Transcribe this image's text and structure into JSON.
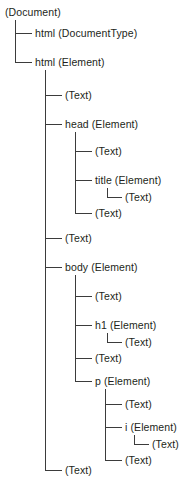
{
  "diagram": {
    "type": "tree",
    "background_color": "#ffffff",
    "text_color": "#231f20",
    "line_color": "#3b3b3b",
    "nodes": [
      {
        "id": "n0",
        "label": "(Document)",
        "depth": 0,
        "x": 5,
        "y": 12,
        "last": false
      },
      {
        "id": "n1",
        "label": "html (DocumentType)",
        "depth": 1,
        "x": 35,
        "y": 33,
        "last": false
      },
      {
        "id": "n2",
        "label": "html (Element)",
        "depth": 1,
        "x": 35,
        "y": 62,
        "last": true
      },
      {
        "id": "n3",
        "label": "(Text)",
        "depth": 2,
        "x": 65,
        "y": 95,
        "last": false
      },
      {
        "id": "n4",
        "label": "head (Element)",
        "depth": 2,
        "x": 65,
        "y": 124,
        "last": false
      },
      {
        "id": "n5",
        "label": "(Text)",
        "depth": 3,
        "x": 95,
        "y": 151,
        "last": false
      },
      {
        "id": "n6",
        "label": "title (Element)",
        "depth": 3,
        "x": 95,
        "y": 180,
        "last": false
      },
      {
        "id": "n7",
        "label": "(Text)",
        "depth": 4,
        "x": 125,
        "y": 197,
        "last": true
      },
      {
        "id": "n8",
        "label": "(Text)",
        "depth": 3,
        "x": 95,
        "y": 213,
        "last": true
      },
      {
        "id": "n9",
        "label": "(Text)",
        "depth": 2,
        "x": 65,
        "y": 238,
        "last": false
      },
      {
        "id": "n10",
        "label": "body (Element)",
        "depth": 2,
        "x": 65,
        "y": 267,
        "last": false
      },
      {
        "id": "n11",
        "label": "(Text)",
        "depth": 3,
        "x": 95,
        "y": 296,
        "last": false
      },
      {
        "id": "n12",
        "label": "h1 (Element)",
        "depth": 3,
        "x": 95,
        "y": 325,
        "last": false
      },
      {
        "id": "n13",
        "label": "(Text)",
        "depth": 4,
        "x": 125,
        "y": 342,
        "last": true
      },
      {
        "id": "n14",
        "label": "(Text)",
        "depth": 3,
        "x": 95,
        "y": 358,
        "last": false
      },
      {
        "id": "n15",
        "label": "p (Element)",
        "depth": 3,
        "x": 95,
        "y": 381,
        "last": true
      },
      {
        "id": "n16",
        "label": "(Text)",
        "depth": 4,
        "x": 125,
        "y": 404,
        "last": false
      },
      {
        "id": "n17",
        "label": "i (Element)",
        "depth": 4,
        "x": 125,
        "y": 427,
        "last": false
      },
      {
        "id": "n18",
        "label": "(Text)",
        "depth": 5,
        "x": 152,
        "y": 444,
        "last": true
      },
      {
        "id": "n19",
        "label": "(Text)",
        "depth": 4,
        "x": 125,
        "y": 460,
        "last": true
      },
      {
        "id": "n20",
        "label": "(Text)",
        "depth": 2,
        "x": 65,
        "y": 470,
        "last": true
      }
    ],
    "connectors": [
      {
        "name": "stem-document",
        "type": "vline",
        "x": 15,
        "y1": 20,
        "y2": 62
      },
      {
        "name": "elbow-documenttype",
        "type": "hline",
        "x1": 15,
        "x2": 32,
        "y": 33
      },
      {
        "name": "elbow-html-element",
        "type": "hline",
        "x1": 15,
        "x2": 32,
        "y": 62
      },
      {
        "name": "stem-html",
        "type": "vline",
        "x": 45,
        "y1": 70,
        "y2": 470
      },
      {
        "name": "elbow-html-text1",
        "type": "hline",
        "x1": 45,
        "x2": 62,
        "y": 95
      },
      {
        "name": "elbow-head",
        "type": "hline",
        "x1": 45,
        "x2": 62,
        "y": 124
      },
      {
        "name": "elbow-html-text2",
        "type": "hline",
        "x1": 45,
        "x2": 62,
        "y": 238
      },
      {
        "name": "elbow-body",
        "type": "hline",
        "x1": 45,
        "x2": 62,
        "y": 267
      },
      {
        "name": "elbow-html-text3",
        "type": "hline",
        "x1": 45,
        "x2": 62,
        "y": 470
      },
      {
        "name": "stem-head",
        "type": "vline",
        "x": 75,
        "y1": 132,
        "y2": 213
      },
      {
        "name": "elbow-head-text1",
        "type": "hline",
        "x1": 75,
        "x2": 92,
        "y": 151
      },
      {
        "name": "elbow-title",
        "type": "hline",
        "x1": 75,
        "x2": 92,
        "y": 180
      },
      {
        "name": "elbow-head-text2",
        "type": "hline",
        "x1": 75,
        "x2": 92,
        "y": 213
      },
      {
        "name": "stem-title",
        "type": "vline",
        "x": 107,
        "y1": 188,
        "y2": 197
      },
      {
        "name": "elbow-title-text",
        "type": "hline",
        "x1": 107,
        "x2": 122,
        "y": 197
      },
      {
        "name": "stem-body",
        "type": "vline",
        "x": 75,
        "y1": 275,
        "y2": 381
      },
      {
        "name": "elbow-body-text1",
        "type": "hline",
        "x1": 75,
        "x2": 92,
        "y": 296
      },
      {
        "name": "elbow-h1",
        "type": "hline",
        "x1": 75,
        "x2": 92,
        "y": 325
      },
      {
        "name": "elbow-body-text2",
        "type": "hline",
        "x1": 75,
        "x2": 92,
        "y": 358
      },
      {
        "name": "elbow-p",
        "type": "hline",
        "x1": 75,
        "x2": 92,
        "y": 381
      },
      {
        "name": "stem-h1",
        "type": "vline",
        "x": 107,
        "y1": 333,
        "y2": 342
      },
      {
        "name": "elbow-h1-text",
        "type": "hline",
        "x1": 107,
        "x2": 122,
        "y": 342
      },
      {
        "name": "stem-p",
        "type": "vline",
        "x": 105,
        "y1": 389,
        "y2": 460
      },
      {
        "name": "elbow-p-text1",
        "type": "hline",
        "x1": 105,
        "x2": 122,
        "y": 404
      },
      {
        "name": "elbow-i",
        "type": "hline",
        "x1": 105,
        "x2": 122,
        "y": 427
      },
      {
        "name": "elbow-p-text2",
        "type": "hline",
        "x1": 105,
        "x2": 122,
        "y": 460
      },
      {
        "name": "stem-i",
        "type": "vline",
        "x": 134,
        "y1": 435,
        "y2": 444
      },
      {
        "name": "elbow-i-text",
        "type": "hline",
        "x1": 134,
        "x2": 149,
        "y": 444
      }
    ]
  }
}
